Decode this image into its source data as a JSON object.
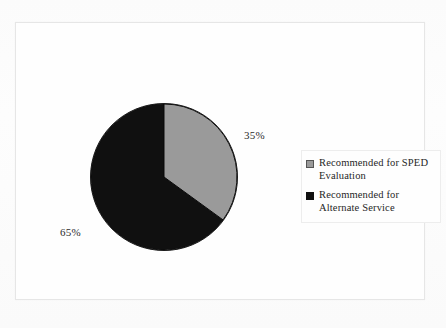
{
  "chart_data": {
    "type": "pie",
    "title": "",
    "subtitle": "",
    "xlabel": "",
    "ylabel": "",
    "legend_position": "right",
    "grid": false,
    "start_angle_deg": 0,
    "direction": "clockwise",
    "categories": [
      "Recommended for SPED Evaluation",
      "Recommended for Alternate Service"
    ],
    "values": [
      35,
      65
    ],
    "unit": "%",
    "data_labels": [
      "35%",
      "65%"
    ],
    "colors": [
      "#9a9a9a",
      "#101010"
    ],
    "slices": [
      {
        "label": "Recommended for SPED Evaluation",
        "legend_label_line1": "Recommended for SPED",
        "legend_label_line2": "Evaluation",
        "value": 35,
        "data_label": "35%",
        "color": "#9a9a9a",
        "marker": "gray-square-swatch"
      },
      {
        "label": "Recommended for Alternate Service",
        "legend_label_line1": "Recommended for",
        "legend_label_line2": "Alternate Service",
        "value": 65,
        "data_label": "65%",
        "color": "#101010",
        "marker": "black-square-swatch"
      }
    ]
  },
  "frame": {
    "border_color": "#e6e6e6",
    "background": "#fefefe"
  },
  "legend": {
    "border_color": "#ededed",
    "items": [
      {
        "text_line1": "Recommended for SPED",
        "text_line2": "Evaluation",
        "color": "#9a9a9a"
      },
      {
        "text_line1": "Recommended for",
        "text_line2": "Alternate Service",
        "color": "#101010"
      }
    ]
  }
}
